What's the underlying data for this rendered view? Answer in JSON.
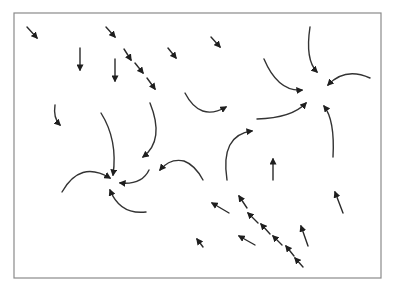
{
  "diagram": {
    "type": "vector-field",
    "colors": {
      "background": "#ffffff",
      "frame": "#8a8a8a",
      "arrow": "#2a2a2a"
    },
    "frame": {
      "x": 14,
      "y": 13,
      "width": 367,
      "height": 265
    },
    "sinks": [
      {
        "id": "sink-left",
        "x": 115,
        "y": 182
      },
      {
        "id": "sink-right",
        "x": 322,
        "y": 77
      }
    ],
    "straight_arrows": [
      {
        "x1": 27,
        "y1": 27,
        "x2": 37,
        "y2": 38
      },
      {
        "x1": 106,
        "y1": 27,
        "x2": 115,
        "y2": 37
      },
      {
        "x1": 80,
        "y1": 48,
        "x2": 80,
        "y2": 70
      },
      {
        "x1": 115,
        "y1": 59,
        "x2": 115,
        "y2": 81
      },
      {
        "x1": 124,
        "y1": 49,
        "x2": 131,
        "y2": 60
      },
      {
        "x1": 135,
        "y1": 63,
        "x2": 143,
        "y2": 73
      },
      {
        "x1": 147,
        "y1": 78,
        "x2": 155,
        "y2": 89
      },
      {
        "x1": 168,
        "y1": 48,
        "x2": 176,
        "y2": 58
      },
      {
        "x1": 211,
        "y1": 37,
        "x2": 220,
        "y2": 47
      },
      {
        "x1": 273,
        "y1": 180,
        "x2": 273,
        "y2": 159
      },
      {
        "x1": 343,
        "y1": 213,
        "x2": 335,
        "y2": 192
      },
      {
        "x1": 229,
        "y1": 213,
        "x2": 212,
        "y2": 203
      },
      {
        "x1": 247,
        "y1": 208,
        "x2": 239,
        "y2": 196
      },
      {
        "x1": 258,
        "y1": 223,
        "x2": 248,
        "y2": 213
      },
      {
        "x1": 270,
        "y1": 234,
        "x2": 261,
        "y2": 224
      },
      {
        "x1": 282,
        "y1": 245,
        "x2": 273,
        "y2": 236
      },
      {
        "x1": 294,
        "y1": 256,
        "x2": 286,
        "y2": 246
      },
      {
        "x1": 303,
        "y1": 267,
        "x2": 295,
        "y2": 258
      },
      {
        "x1": 308,
        "y1": 246,
        "x2": 301,
        "y2": 226
      },
      {
        "x1": 255,
        "y1": 245,
        "x2": 239,
        "y2": 236
      },
      {
        "x1": 203,
        "y1": 247,
        "x2": 197,
        "y2": 239
      }
    ],
    "curved_arrows": [
      {
        "id": "left-sink-from-top",
        "d": "M 101 113 Q 118 140 113 175",
        "head": {
          "x": 113,
          "y": 178,
          "angle": 95
        }
      },
      {
        "id": "left-sink-from-left",
        "d": "M 62 192 Q 80 160 110 178",
        "head": {
          "x": 112,
          "y": 179,
          "angle": 25
        }
      },
      {
        "id": "left-sink-from-right",
        "d": "M 149 170 Q 142 185 120 183",
        "head": {
          "x": 117,
          "y": 183,
          "angle": 180
        }
      },
      {
        "id": "left-sink-from-bottom",
        "d": "M 146 212 Q 120 215 110 190",
        "head": {
          "x": 108,
          "y": 187,
          "angle": 240
        }
      },
      {
        "id": "left-upper-hook",
        "d": "M 55 105 Q 53 118 60 125",
        "head": {
          "x": 61,
          "y": 126,
          "angle": 55
        }
      },
      {
        "id": "left-center-curve",
        "d": "M 150 103 Q 165 140 143 157",
        "head": {
          "x": 141,
          "y": 159,
          "angle": 130
        }
      },
      {
        "id": "mid-curve",
        "d": "M 203 180 Q 195 165 184 161 Q 170 158 160 170",
        "head": {
          "x": 159,
          "y": 172,
          "angle": 150
        }
      },
      {
        "id": "center-up-curve",
        "d": "M 227 180 Q 220 135 252 131",
        "head": {
          "x": 254,
          "y": 131,
          "angle": -15
        }
      },
      {
        "id": "center-top-curve",
        "d": "M 185 93 Q 200 122 226 107",
        "head": {
          "x": 228,
          "y": 106,
          "angle": -30
        }
      },
      {
        "id": "right-sink-from-top",
        "d": "M 310 27 Q 305 60 317 72",
        "head": {
          "x": 319,
          "y": 74,
          "angle": 55
        }
      },
      {
        "id": "right-sink-from-left-top",
        "d": "M 264 59 Q 278 92 302 90",
        "head": {
          "x": 305,
          "y": 90,
          "angle": 0
        }
      },
      {
        "id": "right-sink-from-right",
        "d": "M 370 78 Q 345 67 328 85",
        "head": {
          "x": 326,
          "y": 88,
          "angle": 140
        }
      },
      {
        "id": "right-sink-from-left-bottom",
        "d": "M 257 119 Q 292 118 306 103",
        "head": {
          "x": 307,
          "y": 101,
          "angle": -40
        }
      },
      {
        "id": "right-sink-from-bottom",
        "d": "M 333 157 Q 335 120 324 106",
        "head": {
          "x": 322,
          "y": 104,
          "angle": 230
        }
      }
    ]
  }
}
